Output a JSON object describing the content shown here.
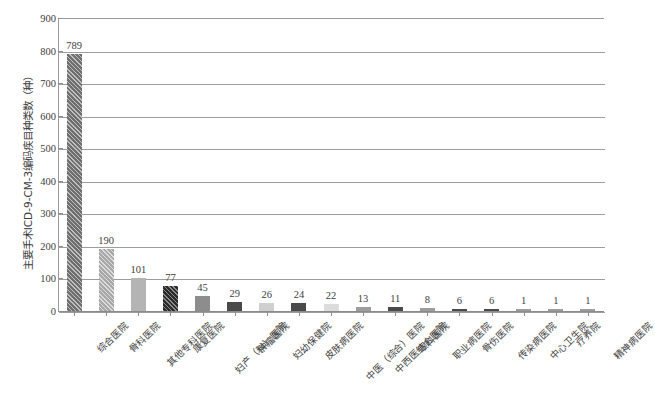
{
  "chart_data": {
    "type": "bar",
    "title": "",
    "subtitle": "",
    "xlabel": "",
    "ylabel": "主要手术ICD-9-CM-3编码疾目种类数（种）",
    "ylim": [
      0,
      900
    ],
    "y_ticks": [
      0,
      100,
      200,
      300,
      400,
      500,
      600,
      700,
      800,
      900
    ],
    "grid": "horizontal",
    "legend": "none",
    "categories": [
      "综合医院",
      "骨科医院",
      "其他专科医院",
      "康复医院",
      "妇产（科）医院",
      "肿瘤医院",
      "妇幼保健院",
      "皮肤病医院",
      "中医（综合）医院",
      "中西医结合医院",
      "眼科医院",
      "职业病医院",
      "骨伤医院",
      "传染病医院",
      "中心卫生院",
      "疗养院",
      "精神病医院"
    ],
    "values": [
      789,
      190,
      101,
      77,
      45,
      29,
      26,
      24,
      22,
      13,
      11,
      8,
      6,
      6,
      1,
      1,
      1
    ],
    "bar_styles": [
      "fill-hatch-dark",
      "fill-hatch-light",
      "fill-solid-light",
      "fill-hatch-black",
      "fill-mid",
      "fill-dark",
      "fill-pale",
      "fill-dark",
      "fill-vlight",
      "fill-grey",
      "fill-dark",
      "fill-grey",
      "fill-dark",
      "fill-dark",
      "fill-grey",
      "fill-grey",
      "fill-grey"
    ],
    "colors": {
      "axis": "#9a9a9a",
      "gridline": "#9d9d9d",
      "text": "#3d3d3d",
      "background": "#ffffff"
    }
  }
}
